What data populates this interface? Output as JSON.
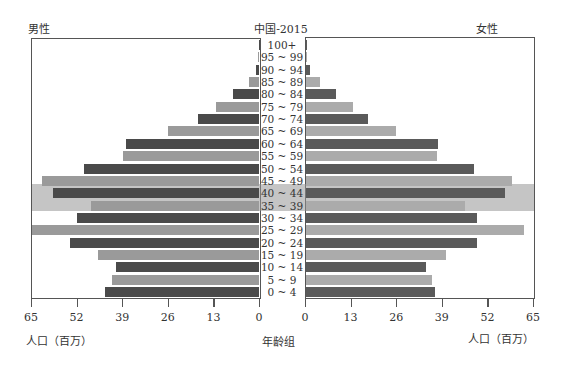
{
  "header": {
    "title": "中国-2015",
    "left_label": "男性",
    "right_label": "女性"
  },
  "footer": {
    "left_axis_label": "人口（百万）",
    "center_label": "年龄组",
    "right_axis_label": "人口（百万）"
  },
  "axes": {
    "left_ticks": [
      "65",
      "52",
      "39",
      "26",
      "13",
      "0"
    ],
    "right_ticks": [
      "0",
      "13",
      "26",
      "39",
      "52",
      "65"
    ]
  },
  "colors": {
    "dark": "#4a4a4a",
    "light": "#9a9a9a",
    "band": "#a8a8a8",
    "frame": "#555555"
  },
  "highlight_band": {
    "groups": [
      "45 ~ 49",
      "40 ~ 44",
      "35 ~ 39"
    ]
  },
  "chart_data": {
    "type": "bar",
    "orientation": "horizontal-pyramid",
    "title": "中国-2015",
    "xlabel": "人口（百万）",
    "ylabel": "年龄组",
    "xlim": [
      0,
      65
    ],
    "x_ticks": [
      0,
      13,
      26,
      39,
      52,
      65
    ],
    "grid": false,
    "legend": "none (side labels 男性 left, 女性 right)",
    "categories": [
      "100+",
      "95 ~ 99",
      "90 ~ 94",
      "85 ~ 89",
      "80 ~ 84",
      "75 ~ 79",
      "70 ~ 74",
      "65 ~ 69",
      "60 ~ 64",
      "55 ~ 59",
      "50 ~ 54",
      "45 ~ 49",
      "40 ~ 44",
      "35 ~ 39",
      "30 ~ 34",
      "25 ~ 29",
      "20 ~ 24",
      "15 ~ 19",
      "10 ~ 14",
      "5 ~ 9",
      "0 ~ 4"
    ],
    "series": [
      {
        "name": "男性",
        "values": [
          0.05,
          0.3,
          0.9,
          2.9,
          7.4,
          12.3,
          17.5,
          26.0,
          38.0,
          39.0,
          50.0,
          62.0,
          59.0,
          48.0,
          52.0,
          65.0,
          54.0,
          46.0,
          41.0,
          42.0,
          44.0
        ]
      },
      {
        "name": "女性",
        "values": [
          0.1,
          0.4,
          1.1,
          4.0,
          8.6,
          13.5,
          17.8,
          25.8,
          37.8,
          37.5,
          48.0,
          59.0,
          57.0,
          45.6,
          49.0,
          62.5,
          49.0,
          40.0,
          34.5,
          36.0,
          37.0
        ]
      }
    ]
  }
}
